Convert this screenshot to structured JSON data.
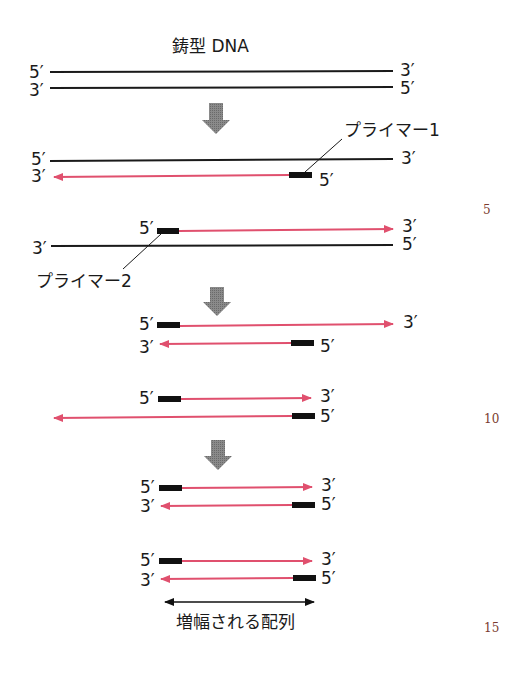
{
  "diagram": {
    "title": "鋳型 DNA",
    "ends": {
      "five_prime": "5′",
      "three_prime": "3′"
    },
    "labels": {
      "primer1": "プライマー1",
      "primer2": "プライマー2",
      "amplified": "増幅される配列"
    },
    "colors": {
      "template_strand": "#1a1a1a",
      "new_strand": "#e0506e",
      "primer": "#111111",
      "step_arrow": "#7f7f7f"
    },
    "steps": [
      {
        "name": "template",
        "strands": [
          "5′→3′ template (black)",
          "3′←5′ template (black)"
        ]
      },
      {
        "name": "primer1-extension",
        "strands": [
          "5′→3′ template (black)",
          "3′←5′ new strand from primer 1 (pink)"
        ]
      },
      {
        "name": "primer2-extension",
        "strands": [
          "5′ primer 2 → 3′ new strand (pink)",
          "3′←5′ template (black)"
        ]
      },
      {
        "name": "cycle2-a",
        "strands": [
          "5′ primer → long 3′ (pink)",
          "3′ ← primer 5′ (pink, short)"
        ]
      },
      {
        "name": "cycle2-b",
        "strands": [
          "5′ primer → 3′ (pink, short)",
          "long ← primer 5′ (pink)"
        ]
      },
      {
        "name": "product-1",
        "strands": [
          "5′ primer → 3′",
          "3′ ← primer 5′"
        ]
      },
      {
        "name": "product-2",
        "strands": [
          "5′ primer → 3′",
          "3′ ← primer 5′"
        ]
      }
    ]
  },
  "margin_numbers": [
    "5",
    "10",
    "15"
  ]
}
